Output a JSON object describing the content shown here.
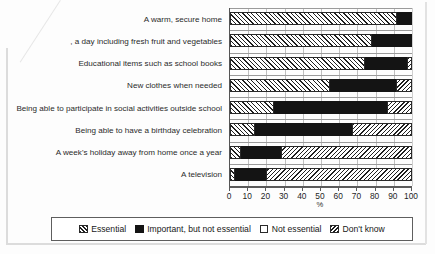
{
  "chart_data": {
    "type": "bar",
    "orientation": "horizontal",
    "stacked": true,
    "title": "",
    "xlabel": "%",
    "ylabel": "",
    "xlim": [
      0,
      100
    ],
    "xticks": [
      0,
      10,
      20,
      30,
      40,
      50,
      60,
      70,
      80,
      90,
      100
    ],
    "grid": true,
    "legend_position": "bottom",
    "categories": [
      "A warm, secure home",
      ", a day including fresh fruit and vegetables",
      "Educational items such as school books",
      "New clothes when needed",
      "Being able to participate in social activities outside school",
      "Being able to have a birthday celebration",
      "A week's holiday away from home once a year",
      "A television"
    ],
    "series": [
      {
        "name": "Essential",
        "values": [
          92,
          78,
          74,
          55,
          24,
          14,
          6,
          3
        ]
      },
      {
        "name": "Important, but not essential",
        "values": [
          8,
          22,
          23,
          36,
          62,
          53,
          22,
          17
        ]
      },
      {
        "name": "Not essential",
        "values": [
          0,
          0,
          0,
          0,
          0,
          0,
          0,
          0
        ]
      },
      {
        "name": "Don't know",
        "values": [
          0,
          0,
          3,
          9,
          14,
          33,
          72,
          80
        ]
      }
    ]
  },
  "legend": {
    "items": [
      {
        "label": "Essential",
        "pattern": "hatch-forward"
      },
      {
        "label": "Important, but not essential",
        "pattern": "solid-black"
      },
      {
        "label": "Not essential",
        "pattern": "white"
      },
      {
        "label": "Don't know",
        "pattern": "hatch-back"
      }
    ]
  },
  "colors": {
    "important": "#141414",
    "hatch_line": "#1f1f1f",
    "background": "#ffffff",
    "axis": "#5a5a5a",
    "gridline": "#bfbfbf"
  }
}
